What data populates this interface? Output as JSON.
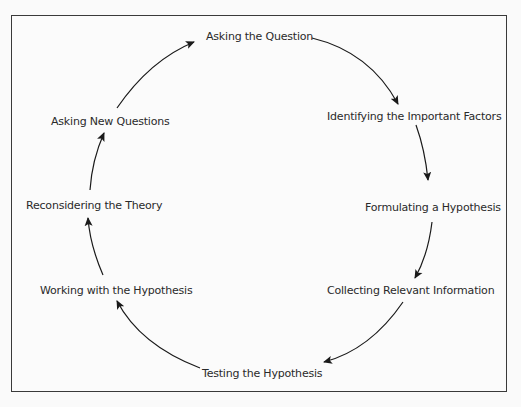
{
  "diagram": {
    "type": "cycle",
    "steps": [
      {
        "label": "Asking the Question"
      },
      {
        "label": "Identifying the Important Factors"
      },
      {
        "label": "Formulating a Hypothesis"
      },
      {
        "label": "Collecting Relevant Information"
      },
      {
        "label": "Testing the Hypothesis"
      },
      {
        "label": "Working with the Hypothesis"
      },
      {
        "label": "Reconsidering the Theory"
      },
      {
        "label": "Asking New Questions"
      }
    ],
    "direction": "clockwise"
  }
}
